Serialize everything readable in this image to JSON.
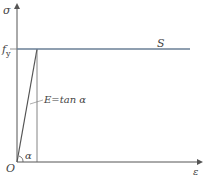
{
  "diagram": {
    "type": "stress-strain ideal elastic-plastic",
    "y_axis_label": "σ",
    "x_axis_label": "ε",
    "origin_label": "O",
    "yield_label": "f",
    "yield_subscript": "y",
    "curve_label": "S",
    "modulus_label": "E=tan α",
    "angle_label": "α",
    "colors": {
      "axis": "#555555",
      "yield_line": "#6a7f96",
      "elastic_line": "#555555"
    }
  }
}
